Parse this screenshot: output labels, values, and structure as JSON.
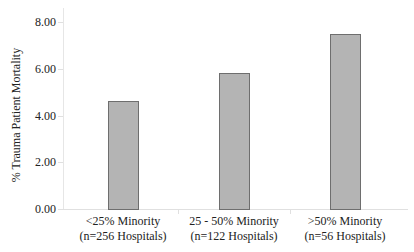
{
  "chart_data": {
    "type": "bar",
    "title": "",
    "xlabel": "",
    "ylabel": "% Trauma Patient Mortality",
    "ylim": [
      0,
      8
    ],
    "yticks": [
      "0.00",
      "2.00",
      "4.00",
      "6.00",
      "8.00"
    ],
    "categories": [
      "<25% Minority (n=256 Hospitals)",
      "25 - 50% Minority (n=122 Hospitals)",
      ">50% Minority (n=56 Hospitals)"
    ],
    "category_lines": [
      [
        "<25% Minority",
        "(n=256 Hospitals)"
      ],
      [
        "25 - 50% Minority",
        "(n=122 Hospitals)"
      ],
      [
        ">50% Minority",
        "(n=56 Hospitals)"
      ]
    ],
    "values": [
      4.6,
      5.8,
      7.5
    ],
    "bar_color": "#b4b4b4",
    "bar_edge_color": "#6e6e6e",
    "grid": false,
    "legend": null
  }
}
